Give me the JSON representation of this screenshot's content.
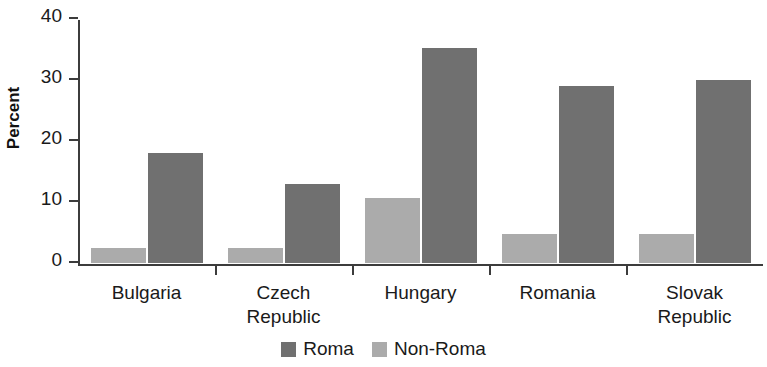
{
  "chart_data": {
    "type": "bar",
    "title": "",
    "subtitle": "",
    "xlabel": "",
    "ylabel": "Percent",
    "ylim": [
      0,
      40
    ],
    "yticks": [
      0,
      10,
      20,
      30,
      40
    ],
    "ytick_labels": [
      "0",
      "10",
      "20",
      "30",
      "40"
    ],
    "grid": false,
    "legend_position": "bottom-center",
    "categories": [
      "Bulgaria",
      "Czech\nRepublic",
      "Hungary",
      "Romania",
      "Slovak\nRepublic"
    ],
    "category_labels_flat": [
      "Bulgaria",
      "Czech Republic",
      "Hungary",
      "Romania",
      "Slovak Republic"
    ],
    "series": [
      {
        "name": "Non-Roma",
        "color": "#ababab",
        "values": [
          2.5,
          2.5,
          10.7,
          4.8,
          4.8
        ]
      },
      {
        "name": "Roma",
        "color": "#707070",
        "values": [
          18.0,
          13.0,
          35.3,
          29.0,
          30.0
        ]
      }
    ]
  },
  "axis": {
    "y_title": "Percent",
    "axis_color": "#3c3c3c"
  },
  "legend": {
    "items": [
      {
        "label": "Roma",
        "color": "#707070",
        "swatch": "dark"
      },
      {
        "label": "Non-Roma",
        "color": "#ababab",
        "swatch": "light"
      }
    ]
  }
}
